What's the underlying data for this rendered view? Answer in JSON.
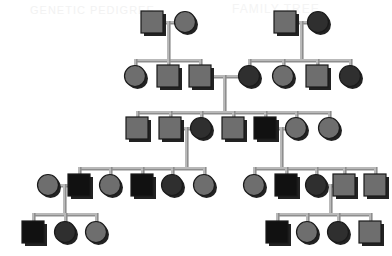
{
  "figure": {
    "kind": "pedigree-chart",
    "width": 392,
    "height": 256,
    "background_color": "#ffffff"
  },
  "watermark": {
    "line1": "GENETIC PEDIGREE",
    "line2": "FAMILY TREE"
  },
  "legend": {
    "square_meaning": "male",
    "circle_meaning": "female",
    "light_fill_meaning": "unaffected",
    "dark_fill_meaning": "carrier",
    "black_fill_meaning": "affected"
  },
  "colors": {
    "unaffected": "#6e6e6e",
    "carrier": "#2f2f2f",
    "affected": "#111111",
    "shadow": "#222222",
    "outline": "#1a1a1a",
    "line": "#b9b9b9",
    "line_dark": "#8e8e8e",
    "background": "#ffffff"
  },
  "generations": [
    {
      "id": "I",
      "label": "Generation I",
      "y": 22,
      "members": [
        {
          "id": "I-1",
          "shape": "square",
          "fill": "unaffected",
          "x": 152,
          "y": 22
        },
        {
          "id": "I-2",
          "shape": "circle",
          "fill": "unaffected",
          "x": 185,
          "y": 22
        },
        {
          "id": "I-3",
          "shape": "square",
          "fill": "unaffected",
          "x": 285,
          "y": 22
        },
        {
          "id": "I-4",
          "shape": "circle",
          "fill": "carrier",
          "x": 318,
          "y": 22
        }
      ]
    },
    {
      "id": "II",
      "label": "Generation II",
      "y": 76,
      "members": [
        {
          "id": "II-1",
          "shape": "circle",
          "fill": "unaffected",
          "x": 135,
          "y": 76
        },
        {
          "id": "II-2",
          "shape": "square",
          "fill": "unaffected",
          "x": 168,
          "y": 76
        },
        {
          "id": "II-3",
          "shape": "square",
          "fill": "unaffected",
          "x": 200,
          "y": 76
        },
        {
          "id": "II-4",
          "shape": "circle",
          "fill": "carrier",
          "x": 249,
          "y": 76
        },
        {
          "id": "II-5",
          "shape": "circle",
          "fill": "unaffected",
          "x": 283,
          "y": 76
        },
        {
          "id": "II-6",
          "shape": "square",
          "fill": "unaffected",
          "x": 317,
          "y": 76
        },
        {
          "id": "II-7",
          "shape": "circle",
          "fill": "carrier",
          "x": 350,
          "y": 76
        }
      ]
    },
    {
      "id": "III",
      "label": "Generation III",
      "y": 128,
      "members": [
        {
          "id": "III-1",
          "shape": "square",
          "fill": "unaffected",
          "x": 137,
          "y": 128
        },
        {
          "id": "III-2",
          "shape": "square",
          "fill": "unaffected",
          "x": 170,
          "y": 128
        },
        {
          "id": "III-3",
          "shape": "circle",
          "fill": "carrier",
          "x": 201,
          "y": 128
        },
        {
          "id": "III-4",
          "shape": "square",
          "fill": "unaffected",
          "x": 233,
          "y": 128
        },
        {
          "id": "III-5",
          "shape": "square",
          "fill": "affected",
          "x": 265,
          "y": 128
        },
        {
          "id": "III-6",
          "shape": "circle",
          "fill": "unaffected",
          "x": 296,
          "y": 128
        },
        {
          "id": "III-7",
          "shape": "circle",
          "fill": "unaffected",
          "x": 329,
          "y": 128
        }
      ]
    },
    {
      "id": "IV",
      "label": "Generation IV",
      "y": 185,
      "members": [
        {
          "id": "IV-1",
          "shape": "circle",
          "fill": "unaffected",
          "x": 48,
          "y": 185
        },
        {
          "id": "IV-2",
          "shape": "square",
          "fill": "affected",
          "x": 79,
          "y": 185
        },
        {
          "id": "IV-3",
          "shape": "circle",
          "fill": "unaffected",
          "x": 110,
          "y": 185
        },
        {
          "id": "IV-4",
          "shape": "square",
          "fill": "affected",
          "x": 142,
          "y": 185
        },
        {
          "id": "IV-5",
          "shape": "circle",
          "fill": "carrier",
          "x": 172,
          "y": 185
        },
        {
          "id": "IV-6",
          "shape": "circle",
          "fill": "unaffected",
          "x": 204,
          "y": 185
        },
        {
          "id": "IV-7",
          "shape": "circle",
          "fill": "unaffected",
          "x": 254,
          "y": 185
        },
        {
          "id": "IV-8",
          "shape": "square",
          "fill": "affected",
          "x": 286,
          "y": 185
        },
        {
          "id": "IV-9",
          "shape": "circle",
          "fill": "carrier",
          "x": 316,
          "y": 185
        },
        {
          "id": "IV-10",
          "shape": "square",
          "fill": "unaffected",
          "x": 344,
          "y": 185
        },
        {
          "id": "IV-11",
          "shape": "square",
          "fill": "unaffected",
          "x": 375,
          "y": 185
        }
      ]
    },
    {
      "id": "V",
      "label": "Generation V",
      "y": 232,
      "members": [
        {
          "id": "V-1",
          "shape": "square",
          "fill": "affected",
          "x": 33,
          "y": 232
        },
        {
          "id": "V-2",
          "shape": "circle",
          "fill": "carrier",
          "x": 65,
          "y": 232
        },
        {
          "id": "V-3",
          "shape": "circle",
          "fill": "unaffected",
          "x": 96,
          "y": 232
        },
        {
          "id": "V-4",
          "shape": "square",
          "fill": "affected",
          "x": 277,
          "y": 232
        },
        {
          "id": "V-5",
          "shape": "circle",
          "fill": "unaffected",
          "x": 307,
          "y": 232
        },
        {
          "id": "V-6",
          "shape": "circle",
          "fill": "carrier",
          "x": 338,
          "y": 232
        },
        {
          "id": "V-7",
          "shape": "square",
          "fill": "unaffected",
          "x": 370,
          "y": 232
        }
      ]
    }
  ],
  "unions": [
    {
      "id": "U1",
      "partners": [
        "I-1",
        "I-2"
      ],
      "mating_y": 22,
      "drop_x": 168,
      "sib_y": 60,
      "children": [
        "II-1",
        "II-2",
        "II-3"
      ]
    },
    {
      "id": "U2",
      "partners": [
        "I-3",
        "I-4"
      ],
      "mating_y": 22,
      "drop_x": 301,
      "sib_y": 60,
      "children": [
        "II-4",
        "II-5",
        "II-6",
        "II-7"
      ]
    },
    {
      "id": "U3",
      "partners": [
        "II-3",
        "II-4"
      ],
      "mating_y": 76,
      "drop_x": 224,
      "sib_y": 112,
      "children": [
        "III-1",
        "III-2",
        "III-3",
        "III-4",
        "III-5",
        "III-6",
        "III-7"
      ]
    },
    {
      "id": "U4",
      "partners": [
        "III-2",
        "III-3"
      ],
      "mating_y": 128,
      "drop_x": 186,
      "sib_y": 168,
      "children": [
        "IV-2",
        "IV-3",
        "IV-4",
        "IV-5",
        "IV-6"
      ]
    },
    {
      "id": "U5",
      "partners": [
        "III-5",
        "III-6"
      ],
      "mating_y": 128,
      "drop_x": 281,
      "sib_y": 168,
      "children": [
        "IV-7",
        "IV-8",
        "IV-9",
        "IV-10",
        "IV-11"
      ]
    },
    {
      "id": "U6",
      "partners": [
        "IV-1",
        "IV-2"
      ],
      "mating_y": 185,
      "drop_x": 64,
      "sib_y": 214,
      "children": [
        "V-1",
        "V-2",
        "V-3"
      ]
    },
    {
      "id": "U7",
      "partners": [
        "IV-9",
        "IV-10"
      ],
      "mating_y": 185,
      "drop_x": 330,
      "sib_y": 214,
      "children": [
        "V-4",
        "V-5",
        "V-6",
        "V-7"
      ]
    }
  ]
}
